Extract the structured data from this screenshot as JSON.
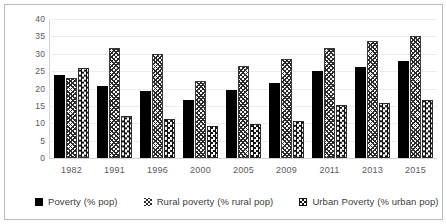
{
  "chart_data": {
    "type": "bar",
    "title": "",
    "subtitle": "",
    "xlabel": "",
    "ylabel": "",
    "categories": [
      "1982",
      "1991",
      "1996",
      "2000",
      "2005",
      "2009",
      "2011",
      "2013",
      "2015"
    ],
    "series": [
      {
        "name": "Poverty (% pop)",
        "pattern": "solid-black",
        "values": [
          23.8,
          20.6,
          19.3,
          16.6,
          19.6,
          21.5,
          25.0,
          26.2,
          27.8
        ]
      },
      {
        "name": "Rural poverty (% rural pop)",
        "pattern": "zigzag-hatch",
        "values": [
          23.0,
          31.8,
          29.8,
          22.3,
          26.5,
          28.5,
          31.8,
          33.8,
          35.0
        ]
      },
      {
        "name": "Urban Poverty (% urban pop)",
        "pattern": "checkerboard",
        "values": [
          25.8,
          12.2,
          11.2,
          9.2,
          9.8,
          10.6,
          15.2,
          15.9,
          16.8
        ]
      }
    ],
    "ylim": [
      0,
      40
    ],
    "yticks": [
      0,
      5,
      10,
      15,
      20,
      25,
      30,
      35,
      40
    ],
    "ytick_labels": [
      "0",
      "5",
      "10",
      "15",
      "20",
      "25",
      "30",
      "35",
      "40"
    ],
    "grid": true,
    "grid_axis": "y",
    "legend_position": "bottom",
    "legend_entries": [
      "Poverty (% pop)",
      "Rural poverty (% rural pop)",
      "Urban Poverty (% urban pop)"
    ],
    "colors": {
      "series_1": "#000000",
      "series_2": "#2b2b2b",
      "series_3": "#111111",
      "grid": "#ececec",
      "axis": "#d4d4d4",
      "tick_text": "#58595b",
      "legend_text": "#3b3b3b",
      "frame": "#b9b9b9",
      "background": "#ffffff"
    }
  }
}
